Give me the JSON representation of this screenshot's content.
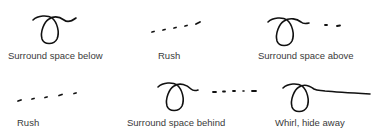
{
  "figure": {
    "items": [
      {
        "id": "surround-below",
        "label": "Surround space below",
        "glyph": "loop-with-tail"
      },
      {
        "id": "rush-1",
        "label": "Rush",
        "glyph": "dashes-rising"
      },
      {
        "id": "surround-above",
        "label": "Surround space above",
        "glyph": "loop-with-tail-dashes"
      },
      {
        "id": "rush-2",
        "label": "Rush",
        "glyph": "dashes-rising"
      },
      {
        "id": "surround-behind",
        "label": "Surround space behind",
        "glyph": "loop-with-tail-dashes"
      },
      {
        "id": "whirl-hide",
        "label": "Whirl, hide away",
        "glyph": "loop-with-long-tail"
      }
    ]
  }
}
